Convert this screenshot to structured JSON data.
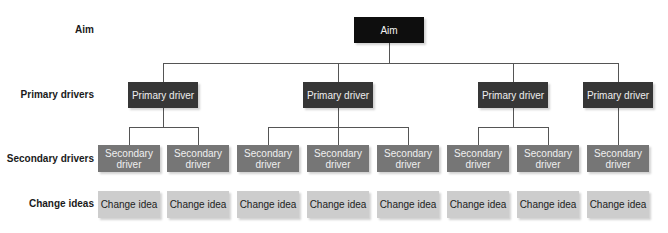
{
  "row_labels": {
    "aim": "Aim",
    "primary": "Primary drivers",
    "secondary": "Secondary drivers",
    "change": "Change ideas"
  },
  "aim": {
    "label": "Aim"
  },
  "primary_drivers": [
    {
      "label": "Primary driver"
    },
    {
      "label": "Primary driver"
    },
    {
      "label": "Primary driver"
    },
    {
      "label": "Primary driver"
    }
  ],
  "secondary_drivers": [
    {
      "label": "Secondary driver",
      "parent": 0
    },
    {
      "label": "Secondary driver",
      "parent": 0
    },
    {
      "label": "Secondary driver",
      "parent": 1
    },
    {
      "label": "Secondary driver",
      "parent": 1
    },
    {
      "label": "Secondary driver",
      "parent": 1
    },
    {
      "label": "Secondary driver",
      "parent": 2
    },
    {
      "label": "Secondary driver",
      "parent": 2
    },
    {
      "label": "Secondary driver",
      "parent": 3
    }
  ],
  "change_ideas": [
    {
      "label": "Change idea"
    },
    {
      "label": "Change idea"
    },
    {
      "label": "Change idea"
    },
    {
      "label": "Change idea"
    },
    {
      "label": "Change idea"
    },
    {
      "label": "Change idea"
    },
    {
      "label": "Change idea"
    },
    {
      "label": "Change idea"
    }
  ],
  "colors": {
    "aim": "#0e0e0e",
    "primary": "#363636",
    "secondary": "#767676",
    "change": "#cdcdcd",
    "connector": "#555555"
  }
}
